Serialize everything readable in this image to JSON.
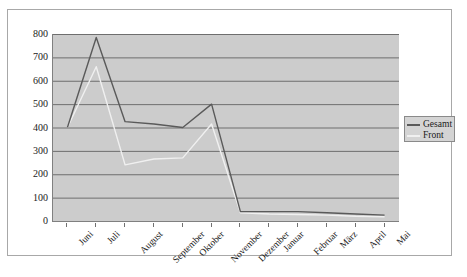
{
  "chart_data": {
    "type": "line",
    "title": "",
    "xlabel": "",
    "ylabel": "",
    "ylim": [
      0,
      800
    ],
    "ytick_step": 100,
    "yticks": [
      "0",
      "100",
      "200",
      "300",
      "400",
      "500",
      "600",
      "700",
      "800"
    ],
    "grid": true,
    "legend_position": "right",
    "categories": [
      "Juni",
      "Juli",
      "August",
      "September",
      "Oktober",
      "November",
      "Dezember",
      "Januar",
      "Februar",
      "März",
      "April",
      "Mai"
    ],
    "series": [
      {
        "name": "Gesamt",
        "color": "#5a5a5a",
        "values": [
          400,
          785,
          425,
          415,
          400,
          500,
          40,
          40,
          40,
          35,
          30,
          25
        ]
      },
      {
        "name": "Front",
        "color": "#f0f0f0",
        "values": [
          400,
          660,
          240,
          265,
          270,
          415,
          35,
          30,
          28,
          25,
          20,
          18
        ]
      }
    ]
  },
  "legend": {
    "items": [
      {
        "label": "Gesamt",
        "color": "#5a5a5a"
      },
      {
        "label": "Front",
        "color": "#f0f0f0"
      }
    ]
  },
  "colors": {
    "plot_background": "#cccccc",
    "gridline": "#6e6e6e",
    "axis": "#808080",
    "frame": "#a8a8a8",
    "legend_background": "#d4d4d4",
    "text": "#1a1a1a"
  }
}
